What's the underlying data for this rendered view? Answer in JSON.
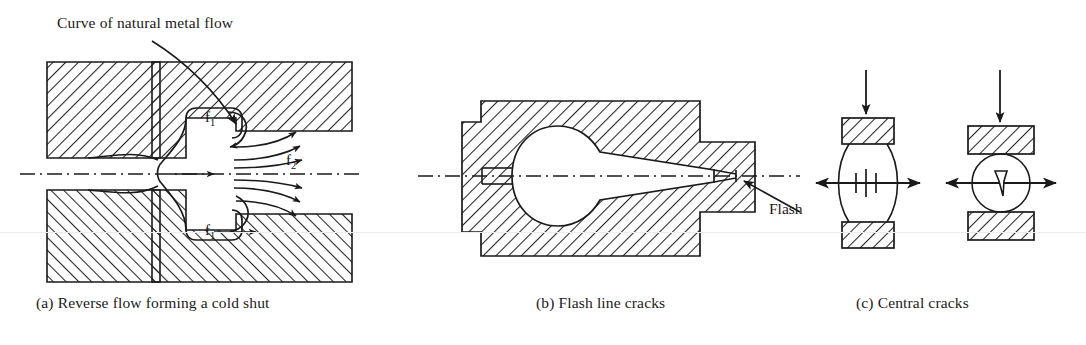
{
  "figure": {
    "kind": "engineering-diagram",
    "background_color": "#ffffff",
    "line_color": "#1a1a1a",
    "hatch_color": "#262626"
  },
  "annotations": {
    "curve_label": "Curve of natural metal flow",
    "flash_label": "Flash",
    "flow_f1_top": "f",
    "flow_f1_top_sub": "1",
    "flow_f1_bottom": "f",
    "flow_f1_bottom_sub": "1",
    "flow_f2": "f",
    "flow_f2_sub": "2"
  },
  "panels": [
    {
      "id": "a",
      "caption": "(a) Reverse flow forming a cold shut",
      "elements": [
        "upper die block",
        "lower die block",
        "die cavity",
        "flash land",
        "metal flow streamlines",
        "centerline axis"
      ]
    },
    {
      "id": "b",
      "caption": "(b) Flash line cracks",
      "elements": [
        "die block with bulbous cavity",
        "flash gap",
        "centerline axis",
        "flash leader arrow"
      ]
    },
    {
      "id": "c",
      "caption": "(c) Central cracks",
      "elements": [
        "upper die",
        "lower die",
        "barrelled billet with internal crack",
        "round billet with internal crack",
        "downward load arrows",
        "lateral tension arrows"
      ]
    }
  ]
}
